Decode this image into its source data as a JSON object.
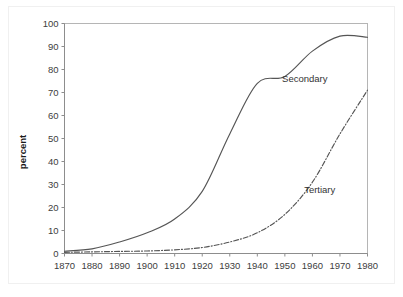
{
  "chart_data": {
    "type": "line",
    "title": "",
    "xlabel": "",
    "ylabel": "percent",
    "xlim": [
      1870,
      1980
    ],
    "ylim": [
      0,
      100
    ],
    "grid": false,
    "legend_position": "inline-annotations",
    "x": [
      1870,
      1880,
      1890,
      1900,
      1910,
      1920,
      1930,
      1940,
      1950,
      1960,
      1970,
      1980
    ],
    "xticklabels": [
      "1870",
      "1880",
      "1890",
      "1900",
      "1910",
      "1920",
      "1930",
      "1940",
      "1950",
      "1960",
      "1970",
      "1980"
    ],
    "yticks": [
      0,
      10,
      20,
      30,
      40,
      50,
      60,
      70,
      80,
      90,
      100
    ],
    "yticklabels": [
      "0",
      "10",
      "20",
      "30",
      "40",
      "50",
      "60",
      "70",
      "80",
      "90",
      "100"
    ],
    "series": [
      {
        "name": "Secondary",
        "style": "solid",
        "color": "#555555",
        "values": [
          1,
          2,
          5,
          9,
          15,
          27,
          52,
          74,
          77,
          88,
          94.5,
          94
        ],
        "annotation": {
          "text": "Secondary",
          "x": 1949,
          "y": 76
        }
      },
      {
        "name": "Tertiary",
        "style": "dash-dot",
        "color": "#555555",
        "values": [
          0.5,
          0.7,
          0.9,
          1.1,
          1.6,
          2.6,
          5,
          9,
          17,
          31,
          52,
          71
        ],
        "annotation": {
          "text": "Tertiary",
          "x": 1957,
          "y": 28
        }
      }
    ]
  }
}
